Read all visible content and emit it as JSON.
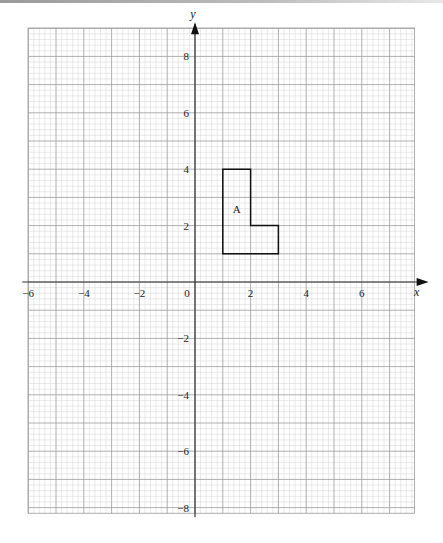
{
  "chart_data": {
    "type": "scatter",
    "title": "",
    "xlabel": "x",
    "ylabel": "y",
    "xlim": [
      -6,
      7.9
    ],
    "ylim": [
      -8.2,
      9.0
    ],
    "grid": true,
    "grid_minor_step": 0.2,
    "grid_major_step": 1,
    "x_ticks": [
      -6,
      -4,
      -2,
      0,
      2,
      4,
      6
    ],
    "y_ticks": [
      -8,
      -6,
      -4,
      -2,
      2,
      4,
      6,
      8
    ],
    "x_tick_labels": [
      "−6",
      "−4",
      "−2",
      "0",
      "2",
      "4",
      "6"
    ],
    "y_tick_labels": [
      "−8",
      "−6",
      "−4",
      "−2",
      "2",
      "4",
      "6",
      "8"
    ],
    "shapes": [
      {
        "name": "A",
        "label": "A",
        "label_position": [
          1.5,
          2.6
        ],
        "vertices": [
          [
            1,
            1
          ],
          [
            1,
            4
          ],
          [
            2,
            4
          ],
          [
            2,
            2
          ],
          [
            3,
            2
          ],
          [
            3,
            1
          ]
        ]
      }
    ]
  },
  "labels": {
    "x_axis": "x",
    "y_axis": "y",
    "origin": "0",
    "shape_label": "A"
  }
}
